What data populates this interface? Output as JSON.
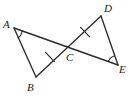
{
  "figure": {
    "type": "geometry-diagram",
    "width": 138,
    "height": 99,
    "background_color": "#ffffff",
    "stroke_color": "#2b2b2b",
    "label_color": "#1b1b1b"
  },
  "points": [
    {
      "name": "A",
      "label": "A",
      "x": 14,
      "y": 28,
      "label_x": 3,
      "label_y": 19
    },
    {
      "name": "B",
      "label": "B",
      "x": 36,
      "y": 77,
      "label_x": 27,
      "label_y": 82
    },
    {
      "name": "C",
      "label": "C",
      "x": 65,
      "y": 52,
      "label_x": 66,
      "label_y": 52
    },
    {
      "name": "D",
      "label": "D",
      "x": 101,
      "y": 16,
      "label_x": 104,
      "label_y": 3
    },
    {
      "name": "E",
      "label": "E",
      "x": 118,
      "y": 65,
      "label_x": 119,
      "label_y": 64
    }
  ],
  "segments": [
    {
      "name": "segment-AE",
      "from": "A",
      "to": "E",
      "x1": 14,
      "y1": 28,
      "x2": 118,
      "y2": 65
    },
    {
      "name": "segment-AB",
      "from": "A",
      "to": "B",
      "x1": 14,
      "y1": 28,
      "x2": 36,
      "y2": 77
    },
    {
      "name": "segment-BD",
      "from": "B",
      "to": "D",
      "x1": 36,
      "y1": 77,
      "x2": 101,
      "y2": 16
    },
    {
      "name": "segment-DE",
      "from": "D",
      "to": "E",
      "x1": 101,
      "y1": 16,
      "x2": 118,
      "y2": 65
    }
  ],
  "tick_marks": [
    {
      "name": "tick-BC",
      "on_segment": "BC",
      "count": 1,
      "x": 50,
      "y": 57
    },
    {
      "name": "tick-CD",
      "on_segment": "CD",
      "count": 1,
      "x": 85,
      "y": 32
    }
  ],
  "angle_arcs": [
    {
      "name": "angle-arc-A",
      "at_vertex": "A",
      "between": "AB and AE"
    },
    {
      "name": "angle-arc-E",
      "at_vertex": "E",
      "between": "ED and EA"
    }
  ]
}
